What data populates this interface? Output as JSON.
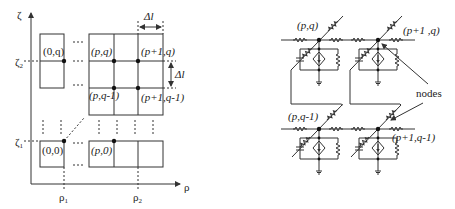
{
  "grid": {
    "axis_vertical_label": "ζ",
    "axis_horizontal_label": "ρ",
    "zeta2_label": "ζ",
    "zeta2_sub": "2",
    "zeta1_label": "ζ",
    "zeta1_sub": "1",
    "rho1_label": "ρ",
    "rho1_sub": "1",
    "rho2_label": "ρ",
    "rho2_sub": "2",
    "node_0q": "(0,q)",
    "node_pq": "(p,q)",
    "node_p1q": "(p+1,q)",
    "node_pq1": "(p,q-1)",
    "node_p1q1": "(p+1,q-1)",
    "node_00": "(0,0)",
    "node_p0": "(p,0)",
    "delta_l_h": "Δl",
    "delta_l_v": "Δl"
  },
  "circuit": {
    "node_pq": "(p,q)",
    "node_p1q": "(p+1 ,q)",
    "node_pq1": "(p,q-1)",
    "node_p1q1": "(p+1,q-1)",
    "nodes_label": "nodes"
  }
}
